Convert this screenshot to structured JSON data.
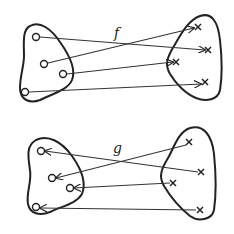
{
  "diagram": {
    "type": "function-mapping",
    "mappings": [
      {
        "label": "f",
        "direction": "left-to-right",
        "domain_points": 4,
        "codomain_points": 4,
        "domain_marker": "circle",
        "codomain_marker": "cross"
      },
      {
        "label": "g",
        "direction": "right-to-left",
        "domain_points": 4,
        "codomain_points": 4,
        "domain_marker": "cross",
        "codomain_marker": "circle"
      }
    ]
  }
}
